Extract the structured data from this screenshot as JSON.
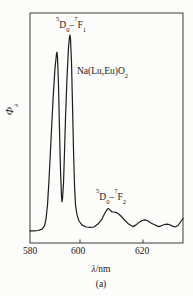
{
  "figure": {
    "sample_label": {
      "base": "Na(Lu,Eu)O",
      "sub": "2"
    },
    "y_axis": {
      "symbol": "Φ",
      "sub": "λ"
    },
    "x_axis": {
      "symbol": "λ",
      "rest": "/nm",
      "ticks": [
        "580",
        "600",
        "620"
      ]
    },
    "caption": "(a)",
    "transitions": {
      "f1": {
        "sup1": "5",
        "base1": "D",
        "sub1": "0",
        "sep": "–",
        "sup2": "7",
        "base2": "F",
        "sub2": "1"
      },
      "f2": {
        "sup1": "5",
        "base1": "D",
        "sub1": "0",
        "sep": "–",
        "sup2": "7",
        "base2": "F",
        "sub2": "2"
      }
    }
  },
  "chart_data": {
    "type": "line",
    "title": "",
    "xlabel": "λ/nm",
    "ylabel": "Φλ (relative photon flux)",
    "xlim": [
      580,
      633
    ],
    "ylim": [
      0,
      1.1
    ],
    "x_ticks": [
      580,
      600,
      620
    ],
    "grid": false,
    "legend": "none",
    "annotations": [
      {
        "text": "5D0–7F1",
        "x": 591,
        "y": 1.02
      },
      {
        "text": "Na(Lu,Eu)O2",
        "x": 600,
        "y": 0.82
      },
      {
        "text": "5D0–7F2",
        "x": 610,
        "y": 0.24
      }
    ],
    "series": [
      {
        "name": "emission spectrum",
        "points": [
          [
            580.0,
            0.058
          ],
          [
            581.6,
            0.058
          ],
          [
            583.2,
            0.06
          ],
          [
            584.8,
            0.067
          ],
          [
            585.8,
            0.082
          ],
          [
            586.4,
            0.115
          ],
          [
            587.0,
            0.183
          ],
          [
            587.6,
            0.303
          ],
          [
            588.4,
            0.495
          ],
          [
            589.2,
            0.688
          ],
          [
            590.0,
            0.841
          ],
          [
            590.6,
            0.909
          ],
          [
            590.8,
            0.918
          ],
          [
            591.0,
            0.894
          ],
          [
            591.4,
            0.76
          ],
          [
            591.8,
            0.543
          ],
          [
            592.2,
            0.351
          ],
          [
            592.6,
            0.226
          ],
          [
            592.8,
            0.197
          ],
          [
            593.0,
            0.212
          ],
          [
            593.4,
            0.288
          ],
          [
            593.8,
            0.438
          ],
          [
            594.2,
            0.601
          ],
          [
            594.8,
            0.793
          ],
          [
            595.4,
            0.942
          ],
          [
            595.8,
            0.99
          ],
          [
            596.0,
            1.0
          ],
          [
            596.2,
            0.981
          ],
          [
            596.6,
            0.87
          ],
          [
            597.0,
            0.663
          ],
          [
            597.4,
            0.447
          ],
          [
            597.8,
            0.279
          ],
          [
            598.2,
            0.183
          ],
          [
            598.8,
            0.135
          ],
          [
            599.6,
            0.106
          ],
          [
            600.6,
            0.087
          ],
          [
            601.9,
            0.077
          ],
          [
            603.2,
            0.075
          ],
          [
            604.4,
            0.077
          ],
          [
            605.7,
            0.091
          ],
          [
            607.0,
            0.115
          ],
          [
            607.9,
            0.144
          ],
          [
            608.7,
            0.163
          ],
          [
            609.0,
            0.166
          ],
          [
            609.5,
            0.159
          ],
          [
            610.2,
            0.149
          ],
          [
            610.8,
            0.149
          ],
          [
            611.4,
            0.147
          ],
          [
            612.1,
            0.142
          ],
          [
            613.0,
            0.13
          ],
          [
            614.0,
            0.113
          ],
          [
            615.2,
            0.094
          ],
          [
            616.2,
            0.084
          ],
          [
            616.8,
            0.079
          ],
          [
            617.8,
            0.087
          ],
          [
            618.7,
            0.099
          ],
          [
            619.7,
            0.108
          ],
          [
            620.6,
            0.111
          ],
          [
            621.6,
            0.106
          ],
          [
            622.5,
            0.096
          ],
          [
            623.5,
            0.089
          ],
          [
            624.4,
            0.082
          ],
          [
            625.1,
            0.079
          ],
          [
            626.0,
            0.084
          ],
          [
            626.8,
            0.089
          ],
          [
            627.6,
            0.091
          ],
          [
            628.3,
            0.089
          ],
          [
            629.2,
            0.082
          ],
          [
            630.2,
            0.077
          ],
          [
            631.1,
            0.084
          ],
          [
            631.9,
            0.101
          ],
          [
            632.7,
            0.118
          ]
        ]
      }
    ]
  }
}
